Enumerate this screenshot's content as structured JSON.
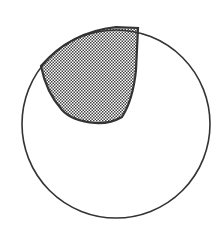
{
  "diagram": {
    "shapes": [
      {
        "name": "outer-circle",
        "type": "circle",
        "fill": "none"
      },
      {
        "name": "shaded-region",
        "type": "region",
        "fill_pattern": "checkered",
        "location": "upper-left"
      }
    ],
    "colors": {
      "stroke": "#333333",
      "pattern_dark": "#555555",
      "pattern_light": "#ffffff",
      "background": "#ffffff"
    }
  }
}
